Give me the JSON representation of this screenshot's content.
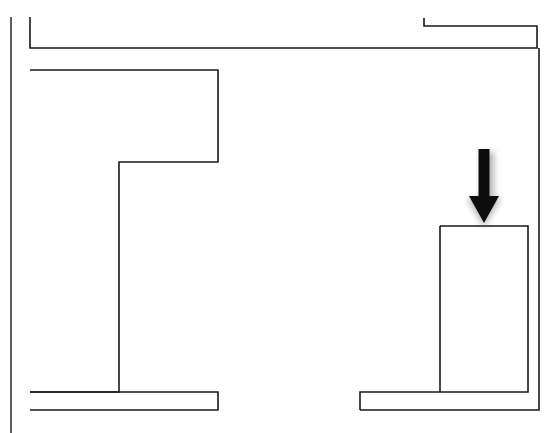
{
  "figure": {
    "background_color": "#ffffff",
    "line_color": "#1a1a1a",
    "arrow_color": "#0d0d0d",
    "canvas": {
      "width": 549,
      "height": 433
    },
    "caption": ""
  },
  "elements": {
    "left_margin_line": {
      "name": "left-margin-line",
      "points": "11,17 11,433"
    },
    "upper_bracket": {
      "name": "upper-bracket-outline",
      "description": "Large outer bracket opening to the right, top band",
      "points": "30,17 30,48 537,48 537,26 424,26 424,18"
    },
    "inner_upper_bracket": {
      "name": "inner-upper-bracket-outline",
      "description": "Top-right small nested rectangle tail",
      "points": "424,18 424,26 424,26"
    },
    "main_stepped_outline": {
      "name": "main-stepped-outline",
      "description": "Large left body with internal step, extends to bottom",
      "points": "30,70 218,70 218,162 119,162 119,392 30,392"
    },
    "lower_band_left": {
      "name": "lower-band-left-outline",
      "points": "30,392 218,392 218,410 30,410"
    },
    "lower_band_right": {
      "name": "lower-band-right-outline",
      "points": "360,410 539,410 539,48"
    },
    "right_block": {
      "name": "right-block-outline",
      "description": "Tall vertical block beneath the arrow",
      "points": "440,226 528,226 528,392 360,392 360,410"
    },
    "right_block_inner_edge": {
      "name": "right-block-inner-edge",
      "points": "440,226 440,392"
    },
    "arrow": {
      "name": "down-arrow",
      "direction": "down",
      "shaft": {
        "x": 484,
        "top": 149,
        "bottom": 198,
        "width": 11
      },
      "head": {
        "cx": 484,
        "top": 196,
        "tip_y": 223,
        "half_width": 15
      }
    }
  },
  "labels": {
    "none": ""
  }
}
